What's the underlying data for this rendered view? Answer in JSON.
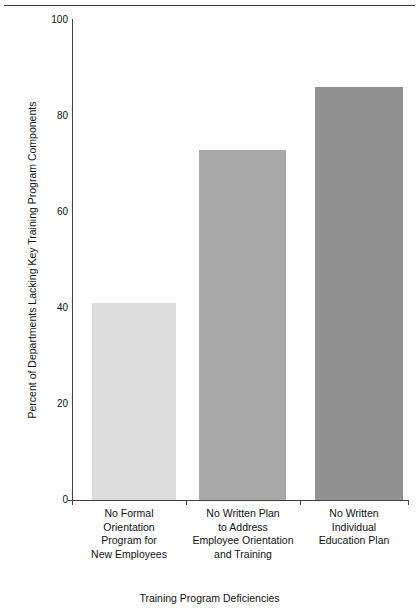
{
  "chart_data": {
    "type": "bar",
    "title": "",
    "xlabel": "Training Program Deficiencies",
    "ylabel": "Percent of Departments Lacking Key Training Program Components",
    "ylim": [
      0,
      100
    ],
    "yticks": [
      0,
      20,
      40,
      60,
      80,
      100
    ],
    "grid": false,
    "legend": "none",
    "categories": [
      "No Formal Orientation Program for New Employees",
      "No Written Plan to Address Employee Orientation and Training",
      "No Written Individual Education Plan"
    ],
    "category_lines": [
      [
        "No Formal",
        "Orientation",
        "Program for",
        "New Employees"
      ],
      [
        "No Written Plan",
        "to Address",
        "Employee Orientation",
        "and Training"
      ],
      [
        "No Written",
        "Individual",
        "Education Plan"
      ]
    ],
    "values": [
      41,
      73,
      86
    ],
    "bar_colors": [
      "#dcdcdc",
      "#a8a8a8",
      "#919191"
    ]
  },
  "ytick_labels": [
    "0",
    "20",
    "40",
    "60",
    "80",
    "100"
  ],
  "axis_titles": {
    "x": "Training Program Deficiencies",
    "y": "Percent of Departments Lacking Key Training Program Components"
  }
}
